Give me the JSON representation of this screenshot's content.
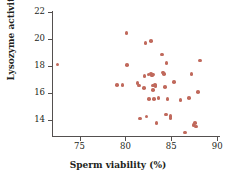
{
  "chart_data": {
    "type": "scatter",
    "title": "",
    "xlabel": "Sperm viability (%)",
    "ylabel": "Lysozyme activity (mm²)",
    "ylabel_text": "Lysozyme activity (mm",
    "ylabel_sup": "2",
    "ylabel_close": ")",
    "xlim": [
      72.0,
      90.2
    ],
    "ylim": [
      12.8,
      22.0
    ],
    "xticks": [
      75,
      80,
      85,
      90
    ],
    "yticks": [
      14,
      16,
      18,
      20,
      22
    ],
    "xtick_labels": [
      "75",
      "80",
      "85",
      "90"
    ],
    "ytick_labels": [
      "14",
      "16",
      "18",
      "20",
      "22"
    ],
    "grid": false,
    "legend": false,
    "marker_color": "#c0695c",
    "axis_color": "#54504f",
    "background": "#ffffff",
    "n_points": 48,
    "points": [
      [
        72.6,
        18.1
      ],
      [
        79.1,
        16.6
      ],
      [
        79.7,
        16.6
      ],
      [
        80.1,
        20.45
      ],
      [
        80.2,
        18.05
      ],
      [
        81.3,
        16.75
      ],
      [
        81.5,
        16.55
      ],
      [
        81.6,
        14.1
      ],
      [
        82.0,
        16.35
      ],
      [
        82.1,
        17.25
      ],
      [
        82.2,
        19.7
      ],
      [
        82.3,
        14.25
      ],
      [
        82.5,
        17.35
      ],
      [
        82.6,
        15.55
      ],
      [
        82.8,
        19.85
      ],
      [
        82.8,
        17.4
      ],
      [
        82.9,
        17.3
      ],
      [
        83.0,
        17.35
      ],
      [
        83.0,
        16.55
      ],
      [
        83.0,
        16.2
      ],
      [
        83.1,
        15.55
      ],
      [
        83.2,
        16.6
      ],
      [
        83.3,
        16.5
      ],
      [
        83.4,
        13.75
      ],
      [
        83.6,
        15.6
      ],
      [
        84.0,
        18.85
      ],
      [
        84.1,
        17.5
      ],
      [
        84.2,
        17.4
      ],
      [
        84.3,
        16.45
      ],
      [
        84.4,
        14.4
      ],
      [
        84.5,
        18.2
      ],
      [
        84.6,
        15.55
      ],
      [
        84.9,
        14.3
      ],
      [
        84.9,
        14.15
      ],
      [
        85.3,
        16.8
      ],
      [
        86.0,
        15.45
      ],
      [
        86.5,
        13.05
      ],
      [
        86.9,
        15.6
      ],
      [
        87.2,
        17.4
      ],
      [
        87.4,
        13.6
      ],
      [
        87.6,
        13.75
      ],
      [
        87.7,
        13.5
      ],
      [
        87.9,
        16.05
      ],
      [
        88.1,
        18.4
      ]
    ]
  }
}
